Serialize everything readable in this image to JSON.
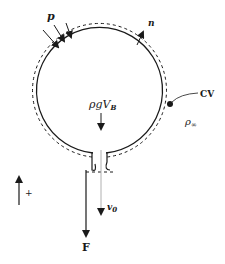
{
  "diagram": {
    "labels": {
      "pressure": "p",
      "normal": "n",
      "buoyancy_rho_g": "ρgV",
      "buoyancy_sub": "B",
      "control_volume": "CV",
      "ambient_density": "ρ",
      "ambient_density_sub": "∞",
      "velocity": "v",
      "velocity_sub": "0",
      "force": "F",
      "positive_direction": "+"
    },
    "colors": {
      "line": "#1a1a1a",
      "background": "#ffffff",
      "velocity_line": "#b0b0b0"
    }
  }
}
